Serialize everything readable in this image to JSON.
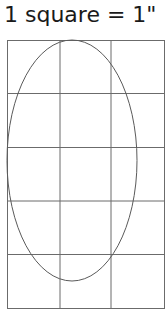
{
  "title": "1 square = 1\"",
  "grid": {
    "columns": 3,
    "rows": 5,
    "unit": "1 inch per square",
    "line_color": "#6b6b6b"
  },
  "ellipse": {
    "width_squares": 2.4,
    "height_squares": 4.5,
    "stroke_color": "#5a5a5a"
  }
}
